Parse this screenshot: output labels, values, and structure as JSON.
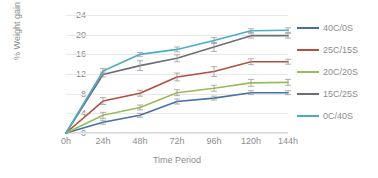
{
  "chart_data": {
    "type": "line",
    "title": "",
    "xlabel": "Time Period",
    "ylabel": "% Weight gain",
    "categories": [
      "0h",
      "24h",
      "48h",
      "72h",
      "96h",
      "120h",
      "144h"
    ],
    "ylim": [
      0,
      24
    ],
    "yticks": [
      0,
      4,
      8,
      12,
      16,
      20,
      24
    ],
    "grid": "horizontal",
    "legend_position": "right",
    "error_bars": true,
    "series": [
      {
        "name": "40C/0S",
        "color": "#4472a4",
        "values": [
          0,
          2.2,
          3.6,
          6.4,
          7.1,
          8.2,
          8.2
        ],
        "errors": [
          0,
          0.4,
          0.4,
          0.5,
          0.4,
          0.4,
          0.4
        ]
      },
      {
        "name": "25C/15S",
        "color": "#b3503c",
        "values": [
          0,
          6.5,
          8.1,
          11.4,
          12.5,
          14.5,
          14.5
        ],
        "errors": [
          0,
          0.7,
          0.6,
          0.8,
          1.0,
          0.6,
          0.5
        ]
      },
      {
        "name": "20C/20S",
        "color": "#9bbb59",
        "values": [
          0,
          3.6,
          5.2,
          8.2,
          9.1,
          10.2,
          10.3
        ],
        "errors": [
          0,
          0.6,
          0.5,
          0.6,
          0.6,
          0.7,
          0.6
        ]
      },
      {
        "name": "15C/25S",
        "color": "#6e6b7b",
        "values": [
          0,
          11.9,
          13.7,
          15.2,
          17.5,
          19.8,
          19.8
        ],
        "errors": [
          0,
          0.5,
          1.0,
          0.7,
          0.9,
          0.5,
          0.5
        ]
      },
      {
        "name": "0C/40S",
        "color": "#4aacc6",
        "values": [
          0,
          12.6,
          16.0,
          17.0,
          18.8,
          20.8,
          20.9
        ],
        "errors": [
          0,
          0.5,
          0.4,
          0.5,
          0.6,
          0.4,
          0.5
        ]
      }
    ]
  }
}
